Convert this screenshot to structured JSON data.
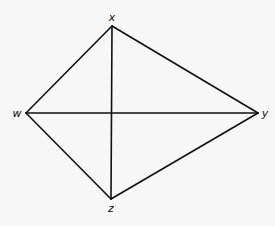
{
  "diagram": {
    "type": "quadrilateral-with-diagonals",
    "vertices": [
      {
        "id": "x",
        "label": "x",
        "pos": [
          112,
          26
        ],
        "label_pos": [
          112,
          21
        ]
      },
      {
        "id": "w",
        "label": "w",
        "pos": [
          26,
          113
        ],
        "label_pos": [
          17,
          117
        ]
      },
      {
        "id": "y",
        "label": "y",
        "pos": [
          258,
          113
        ],
        "label_pos": [
          265,
          117
        ]
      },
      {
        "id": "z",
        "label": "z",
        "pos": [
          111,
          199
        ],
        "label_pos": [
          111,
          212
        ]
      }
    ],
    "edges": [
      {
        "from": "w",
        "to": "x"
      },
      {
        "from": "x",
        "to": "y"
      },
      {
        "from": "y",
        "to": "z"
      },
      {
        "from": "z",
        "to": "w"
      },
      {
        "from": "w",
        "to": "y"
      },
      {
        "from": "x",
        "to": "z"
      }
    ],
    "colors": {
      "line": "#111111",
      "background": "#f7f7f7"
    }
  }
}
